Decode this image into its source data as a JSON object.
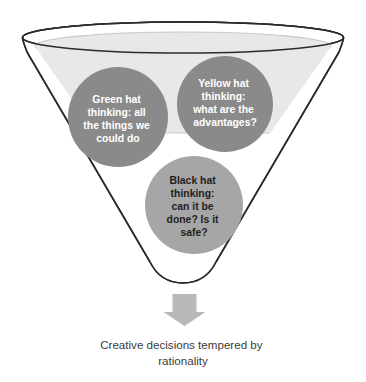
{
  "diagram": {
    "title_caption": {
      "line1": "Creative decisions tempered by",
      "line2": "rationality"
    },
    "funnel": {
      "outline_color": "#2b2b2b",
      "inner_fill_color": "#e8e8e8",
      "body_fill_color": "#ffffff"
    },
    "arrow": {
      "color": "#b9b9b9",
      "direction": "down"
    },
    "nodes": [
      {
        "id": "green-hat",
        "fill": "#8a8a8a",
        "text_color": "#ffffff",
        "lines": [
          "Green hat",
          "thinking: all",
          "the things we",
          "could do"
        ]
      },
      {
        "id": "yellow-hat",
        "fill": "#8a8a8a",
        "text_color": "#ffffff",
        "lines": [
          "Yellow hat",
          "thinking:",
          "what are the",
          "advantages?"
        ]
      },
      {
        "id": "black-hat",
        "fill": "#a6a6a6",
        "text_color": "#231f20",
        "lines": [
          "Black hat",
          "thinking:",
          "can it be",
          "done? Is it",
          "safe?"
        ]
      }
    ]
  }
}
